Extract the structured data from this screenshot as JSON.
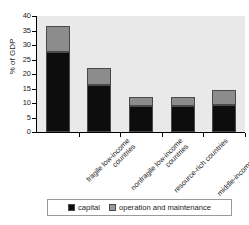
{
  "chart_data": {
    "type": "bar",
    "title": "",
    "xlabel": "",
    "ylabel": "% of GDP",
    "ylim": [
      0,
      40
    ],
    "yticks": [
      0,
      5,
      10,
      15,
      20,
      25,
      30,
      35,
      40
    ],
    "grid": false,
    "stacked": true,
    "legend_position": "bottom",
    "categories": [
      "fragile low-income countries",
      "nonfragile low-income countries",
      "resource-rich countries",
      "middle-income countries",
      "Sub-Saharan Africa"
    ],
    "series": [
      {
        "name": "capital",
        "color": "#0d0d0d",
        "values": [
          27.5,
          16.2,
          9.0,
          8.8,
          9.2
        ]
      },
      {
        "name": "operation and maintenance",
        "color": "#8c8c8c",
        "values": [
          9.0,
          6.0,
          3.0,
          3.2,
          5.3
        ]
      }
    ],
    "totals": [
      36.5,
      22.2,
      12.0,
      12.0,
      14.5
    ]
  },
  "axis": {
    "y_title": "% of GDP",
    "y_tick_labels": [
      "0",
      "5",
      "10",
      "15",
      "20",
      "25",
      "30",
      "35",
      "40"
    ]
  },
  "legend": {
    "items": [
      {
        "label": "capital",
        "color": "#0d0d0d"
      },
      {
        "label": "operation and maintenance",
        "color": "#9a9a9a"
      }
    ]
  }
}
